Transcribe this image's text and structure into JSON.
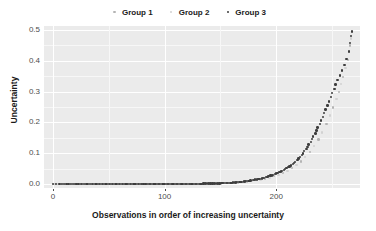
{
  "chart_data": {
    "type": "scatter",
    "title": "",
    "xlabel": "Observations in order of increasing uncertainty",
    "ylabel": "Uncertainty",
    "xlim": [
      -8,
      275
    ],
    "ylim": [
      -0.012,
      0.512
    ],
    "xticks": [
      0,
      100,
      200
    ],
    "xtick_labels": [
      "0",
      "100",
      "200"
    ],
    "yticks": [
      0.0,
      0.1,
      0.2,
      0.3,
      0.4,
      0.5
    ],
    "ytick_labels": [
      "0.0",
      "0.1",
      "0.2",
      "0.3",
      "0.4",
      "0.5"
    ],
    "grid": "white major and minor gridlines on grey panel",
    "legend_position": "top",
    "panel_background": "#ebebeb",
    "gridline_color": "#ffffff",
    "series": [
      {
        "name": "Group 1",
        "color": "#b4b4b4",
        "points": [
          [
            2,
            0.0
          ],
          [
            5,
            0.0
          ],
          [
            7,
            0.0
          ],
          [
            11,
            0.0
          ],
          [
            15,
            0.0
          ],
          [
            19,
            0.0
          ],
          [
            24,
            0.0
          ],
          [
            29,
            0.0
          ],
          [
            34,
            0.0
          ],
          [
            40,
            0.0
          ],
          [
            46,
            0.0
          ],
          [
            52,
            0.0
          ],
          [
            58,
            0.0
          ],
          [
            64,
            0.0
          ],
          [
            71,
            0.0
          ],
          [
            78,
            0.0
          ],
          [
            85,
            0.0
          ],
          [
            93,
            0.0
          ],
          [
            101,
            0.0
          ],
          [
            109,
            0.0
          ],
          [
            117,
            0.0
          ],
          [
            126,
            0.001
          ],
          [
            134,
            0.001
          ],
          [
            142,
            0.002
          ],
          [
            150,
            0.003
          ],
          [
            158,
            0.004
          ],
          [
            166,
            0.006
          ],
          [
            174,
            0.009
          ],
          [
            182,
            0.013
          ],
          [
            190,
            0.019
          ],
          [
            198,
            0.026
          ],
          [
            206,
            0.036
          ],
          [
            214,
            0.052
          ],
          [
            222,
            0.074
          ],
          [
            230,
            0.104
          ],
          [
            238,
            0.145
          ],
          [
            245,
            0.196
          ],
          [
            251,
            0.248
          ],
          [
            256,
            0.299
          ],
          [
            260,
            0.347
          ],
          [
            264,
            0.402
          ],
          [
            266,
            0.449
          ]
        ]
      },
      {
        "name": "Group 2",
        "color": "#d2d2d2",
        "points": [
          [
            1,
            0.0
          ],
          [
            4,
            0.0
          ],
          [
            9,
            0.0
          ],
          [
            13,
            0.0
          ],
          [
            17,
            0.0
          ],
          [
            22,
            0.0
          ],
          [
            27,
            0.0
          ],
          [
            32,
            0.0
          ],
          [
            37,
            0.0
          ],
          [
            43,
            0.0
          ],
          [
            49,
            0.0
          ],
          [
            55,
            0.0
          ],
          [
            61,
            0.0
          ],
          [
            68,
            0.0
          ],
          [
            75,
            0.0
          ],
          [
            82,
            0.0
          ],
          [
            89,
            0.0
          ],
          [
            97,
            0.0
          ],
          [
            105,
            0.0
          ],
          [
            113,
            0.0
          ],
          [
            121,
            0.001
          ],
          [
            130,
            0.001
          ],
          [
            138,
            0.002
          ],
          [
            146,
            0.002
          ],
          [
            154,
            0.004
          ],
          [
            162,
            0.005
          ],
          [
            170,
            0.007
          ],
          [
            178,
            0.011
          ],
          [
            186,
            0.016
          ],
          [
            194,
            0.022
          ],
          [
            202,
            0.031
          ],
          [
            210,
            0.043
          ],
          [
            218,
            0.062
          ],
          [
            226,
            0.088
          ],
          [
            234,
            0.123
          ],
          [
            241,
            0.168
          ],
          [
            248,
            0.223
          ],
          [
            254,
            0.275
          ],
          [
            258,
            0.324
          ],
          [
            262,
            0.376
          ],
          [
            265,
            0.428
          ],
          [
            267,
            0.472
          ]
        ]
      },
      {
        "name": "Group 3",
        "color": "#3d3d3d",
        "points": [
          [
            0,
            0.0
          ],
          [
            3,
            0.0
          ],
          [
            6,
            0.0
          ],
          [
            8,
            0.0
          ],
          [
            10,
            0.0
          ],
          [
            12,
            0.0
          ],
          [
            14,
            0.0
          ],
          [
            16,
            0.0
          ],
          [
            18,
            0.0
          ],
          [
            20,
            0.0
          ],
          [
            21,
            0.0
          ],
          [
            23,
            0.0
          ],
          [
            25,
            0.0
          ],
          [
            26,
            0.0
          ],
          [
            28,
            0.0
          ],
          [
            30,
            0.0
          ],
          [
            31,
            0.0
          ],
          [
            33,
            0.0
          ],
          [
            35,
            0.0
          ],
          [
            36,
            0.0
          ],
          [
            38,
            0.0
          ],
          [
            39,
            0.0
          ],
          [
            41,
            0.0
          ],
          [
            42,
            0.0
          ],
          [
            44,
            0.0
          ],
          [
            45,
            0.0
          ],
          [
            47,
            0.0
          ],
          [
            48,
            0.0
          ],
          [
            50,
            0.0
          ],
          [
            51,
            0.0
          ],
          [
            53,
            0.0
          ],
          [
            54,
            0.0
          ],
          [
            56,
            0.0
          ],
          [
            57,
            0.0
          ],
          [
            59,
            0.0
          ],
          [
            60,
            0.0
          ],
          [
            62,
            0.0
          ],
          [
            63,
            0.0
          ],
          [
            65,
            0.0
          ],
          [
            66,
            0.0
          ],
          [
            67,
            0.0
          ],
          [
            69,
            0.0
          ],
          [
            70,
            0.0
          ],
          [
            72,
            0.0
          ],
          [
            73,
            0.0
          ],
          [
            74,
            0.0
          ],
          [
            76,
            0.0
          ],
          [
            77,
            0.0
          ],
          [
            79,
            0.0
          ],
          [
            80,
            0.0
          ],
          [
            81,
            0.0
          ],
          [
            83,
            0.0
          ],
          [
            84,
            0.0
          ],
          [
            86,
            0.0
          ],
          [
            87,
            0.0
          ],
          [
            88,
            0.0
          ],
          [
            90,
            0.0
          ],
          [
            91,
            0.0
          ],
          [
            92,
            0.0
          ],
          [
            94,
            0.0
          ],
          [
            95,
            0.0
          ],
          [
            96,
            0.0
          ],
          [
            98,
            0.0
          ],
          [
            99,
            0.0
          ],
          [
            100,
            0.0
          ],
          [
            102,
            0.0
          ],
          [
            103,
            0.0
          ],
          [
            104,
            0.0
          ],
          [
            106,
            0.0
          ],
          [
            107,
            0.0
          ],
          [
            108,
            0.0
          ],
          [
            110,
            0.0
          ],
          [
            111,
            0.0
          ],
          [
            112,
            0.0
          ],
          [
            114,
            0.0
          ],
          [
            115,
            0.0
          ],
          [
            116,
            0.0
          ],
          [
            118,
            0.0
          ],
          [
            119,
            0.0
          ],
          [
            120,
            0.0
          ],
          [
            122,
            0.001
          ],
          [
            123,
            0.001
          ],
          [
            124,
            0.001
          ],
          [
            125,
            0.001
          ],
          [
            127,
            0.001
          ],
          [
            128,
            0.001
          ],
          [
            129,
            0.001
          ],
          [
            131,
            0.001
          ],
          [
            132,
            0.001
          ],
          [
            133,
            0.001
          ],
          [
            135,
            0.002
          ],
          [
            136,
            0.002
          ],
          [
            137,
            0.002
          ],
          [
            139,
            0.002
          ],
          [
            140,
            0.002
          ],
          [
            141,
            0.002
          ],
          [
            143,
            0.002
          ],
          [
            144,
            0.003
          ],
          [
            145,
            0.003
          ],
          [
            147,
            0.003
          ],
          [
            148,
            0.003
          ],
          [
            149,
            0.003
          ],
          [
            151,
            0.004
          ],
          [
            152,
            0.004
          ],
          [
            153,
            0.004
          ],
          [
            155,
            0.004
          ],
          [
            156,
            0.005
          ],
          [
            157,
            0.005
          ],
          [
            159,
            0.005
          ],
          [
            160,
            0.005
          ],
          [
            161,
            0.006
          ],
          [
            163,
            0.006
          ],
          [
            164,
            0.006
          ],
          [
            165,
            0.007
          ],
          [
            167,
            0.007
          ],
          [
            168,
            0.008
          ],
          [
            169,
            0.008
          ],
          [
            171,
            0.009
          ],
          [
            172,
            0.009
          ],
          [
            173,
            0.01
          ],
          [
            175,
            0.01
          ],
          [
            176,
            0.011
          ],
          [
            177,
            0.012
          ],
          [
            179,
            0.013
          ],
          [
            180,
            0.014
          ],
          [
            181,
            0.015
          ],
          [
            183,
            0.016
          ],
          [
            184,
            0.017
          ],
          [
            185,
            0.018
          ],
          [
            187,
            0.019
          ],
          [
            188,
            0.02
          ],
          [
            189,
            0.021
          ],
          [
            191,
            0.023
          ],
          [
            192,
            0.024
          ],
          [
            193,
            0.026
          ],
          [
            195,
            0.028
          ],
          [
            196,
            0.029
          ],
          [
            197,
            0.031
          ],
          [
            199,
            0.033
          ],
          [
            200,
            0.035
          ],
          [
            201,
            0.037
          ],
          [
            203,
            0.039
          ],
          [
            204,
            0.041
          ],
          [
            205,
            0.043
          ],
          [
            207,
            0.046
          ],
          [
            208,
            0.049
          ],
          [
            209,
            0.052
          ],
          [
            211,
            0.055
          ],
          [
            212,
            0.058
          ],
          [
            213,
            0.061
          ],
          [
            215,
            0.065
          ],
          [
            216,
            0.069
          ],
          [
            217,
            0.073
          ],
          [
            219,
            0.078
          ],
          [
            220,
            0.083
          ],
          [
            221,
            0.088
          ],
          [
            223,
            0.094
          ],
          [
            224,
            0.1
          ],
          [
            225,
            0.107
          ],
          [
            227,
            0.114
          ],
          [
            228,
            0.121
          ],
          [
            229,
            0.129
          ],
          [
            231,
            0.137
          ],
          [
            232,
            0.146
          ],
          [
            233,
            0.155
          ],
          [
            235,
            0.164
          ],
          [
            236,
            0.174
          ],
          [
            237,
            0.184
          ],
          [
            239,
            0.195
          ],
          [
            240,
            0.206
          ],
          [
            242,
            0.218
          ],
          [
            243,
            0.23
          ],
          [
            244,
            0.242
          ],
          [
            246,
            0.255
          ],
          [
            247,
            0.268
          ],
          [
            249,
            0.282
          ],
          [
            250,
            0.295
          ],
          [
            252,
            0.309
          ],
          [
            253,
            0.323
          ],
          [
            255,
            0.337
          ],
          [
            257,
            0.352
          ],
          [
            259,
            0.368
          ],
          [
            261,
            0.385
          ],
          [
            263,
            0.405
          ],
          [
            265,
            0.43
          ],
          [
            266,
            0.458
          ],
          [
            267,
            0.48
          ],
          [
            268,
            0.494
          ]
        ]
      }
    ]
  },
  "legend": {
    "items": [
      {
        "label": "Group 1",
        "color": "#b4b4b4"
      },
      {
        "label": "Group 2",
        "color": "#d2d2d2"
      },
      {
        "label": "Group 3",
        "color": "#3d3d3d"
      }
    ]
  },
  "axes": {
    "x_title": "Observations in order of increasing uncertainty",
    "y_title": "Uncertainty"
  }
}
